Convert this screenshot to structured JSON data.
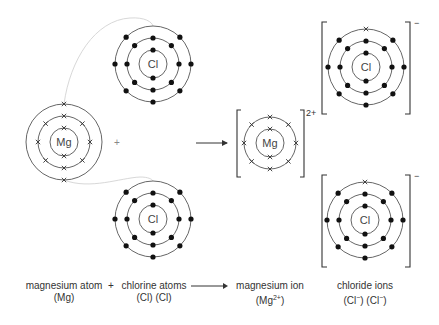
{
  "diagram": {
    "colors": {
      "shell": "#555555",
      "electron_dot": "#111111",
      "electron_cross": "#333333",
      "transfer_curve": "#d8d8d8",
      "text": "#333333"
    },
    "reactants": {
      "magnesium_atom": {
        "symbol": "Mg",
        "shells": [
          2,
          8,
          2
        ],
        "electron_marker": "cross",
        "center": [
          64,
          142
        ]
      },
      "chlorine_atom_top": {
        "symbol": "Cl",
        "shells": [
          2,
          8,
          7
        ],
        "electron_marker": "dot",
        "center": [
          153,
          64
        ]
      },
      "chlorine_atom_bottom": {
        "symbol": "Cl",
        "shells": [
          2,
          8,
          7
        ],
        "electron_marker": "dot",
        "center": [
          153,
          219
        ]
      },
      "plus_sign": "+"
    },
    "products": {
      "magnesium_ion": {
        "symbol": "Mg",
        "shells": [
          2,
          8
        ],
        "electron_marker": "cross",
        "charge": "2+",
        "center": [
          270,
          143
        ]
      },
      "chloride_ion_top": {
        "symbol": "Cl",
        "shells": [
          2,
          8,
          8
        ],
        "gained_electron": "cross",
        "charge": "−",
        "center": [
          366,
          67
        ]
      },
      "chloride_ion_bottom": {
        "symbol": "Cl",
        "shells": [
          2,
          8,
          8
        ],
        "gained_electron": "cross",
        "charge": "−",
        "center": [
          365,
          220
        ]
      }
    }
  },
  "equation": {
    "reactant1": {
      "name": "magnesium atom",
      "formula": "(Mg)"
    },
    "plus": "+",
    "reactant2": {
      "name": "chlorine atoms",
      "formula": "(Cl) (Cl)"
    },
    "product1": {
      "name": "magnesium ion",
      "formula_prefix": "(Mg",
      "formula_sup": "2+",
      "formula_suffix": ")"
    },
    "product2": {
      "name": "chloride ions",
      "formula_a": "(Cl",
      "formula_a_sup": "−",
      "formula_mid": ") (Cl",
      "formula_b_sup": "−",
      "formula_suffix": ")"
    }
  }
}
